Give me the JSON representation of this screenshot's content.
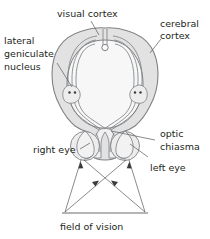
{
  "figure": {
    "background": "#ffffff",
    "ink": "#231f20",
    "line": "#808285",
    "leader": "#58595b",
    "brain_fill": "#e2e2e2",
    "brain_inner_fill": "#f7f7f7"
  },
  "labels": {
    "visual_cortex": "visual cortex",
    "cerebral_cortex_line1": "cerebral",
    "cerebral_cortex_line2": "cortex",
    "lateral_line1": "lateral",
    "lateral_line2": "geniculate",
    "lateral_line3": "nucleus",
    "optic_chiasma_line1": "optic",
    "optic_chiasma_line2": "chiasma",
    "right_eye": "right eye",
    "left_eye": "left eye",
    "field_of_vision": "field of vision"
  },
  "structures": {
    "brain": "cerebral-cortex-outline",
    "inner_region": "brain-inner-region",
    "left_lgn": "lateral-geniculate-nucleus-left",
    "right_lgn": "lateral-geniculate-nucleus-right",
    "chiasma": "optic-chiasma",
    "eye_left": "left-eye",
    "eye_right": "right-eye",
    "visual_field": "field-of-vision-baseline"
  }
}
